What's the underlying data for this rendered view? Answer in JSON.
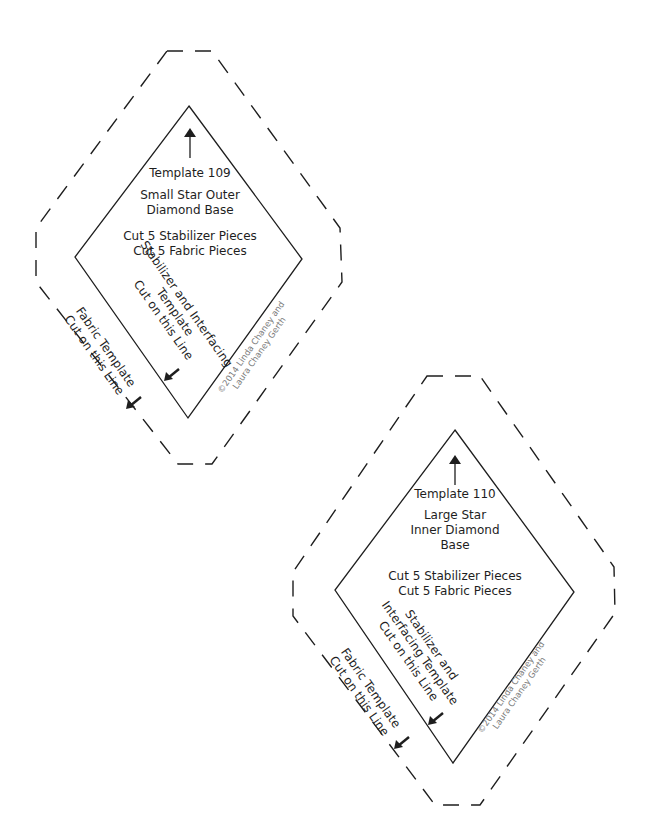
{
  "templates": [
    {
      "number_label": "Template 109",
      "name_lines": [
        "Small Star Outer",
        "Diamond Base"
      ],
      "cut_lines": [
        "Cut 5 Stabilizer Pieces",
        "Cut 5 Fabric Pieces"
      ],
      "inner_line_label": [
        "Stabilizer and Interfacing",
        "Template",
        "Cut on this Line"
      ],
      "outer_line_label": [
        "Fabric Template",
        "Cut on this Line"
      ],
      "copyright": [
        "©2014 Linda Chaney and",
        "Laura Chaney Gerth"
      ]
    },
    {
      "number_label": "Template 110",
      "name_lines": [
        "Large Star",
        "Inner Diamond",
        "Base"
      ],
      "cut_lines": [
        "Cut 5 Stabilizer Pieces",
        "Cut 5 Fabric Pieces"
      ],
      "inner_line_label": [
        "Stabilizer and",
        "Interfacing Template",
        "Cut on this Line"
      ],
      "outer_line_label": [
        "Fabric Template",
        "Cut on this Line"
      ],
      "copyright": [
        "©2014 Linda Chaney and",
        "Laura Chaney Gerth"
      ]
    }
  ],
  "colors": {
    "line": "#1e1e1e",
    "copyright": "#7a7a7a",
    "background": "#ffffff"
  },
  "icons": {
    "grain_arrow": "arrow-up-icon",
    "cut_arrow": "arrow-down-left-icon"
  }
}
